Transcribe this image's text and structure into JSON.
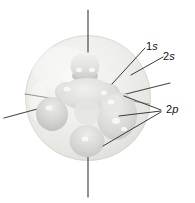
{
  "figure": {
    "labels": {
      "orbital_1s": {
        "num": "1",
        "letter": "s"
      },
      "orbital_2s": {
        "num": "2",
        "letter": "s"
      },
      "orbital_2p": {
        "num": "2",
        "letter": "p"
      }
    },
    "colors": {
      "background": "#ffffff",
      "axis_line": "#4a4a47",
      "leader_line": "#3b3b39",
      "label_text": "#141414",
      "cloud_base": "#ebebe8",
      "lobe_shadow": "#c2c2be",
      "highlight": "#fafaf8"
    }
  }
}
